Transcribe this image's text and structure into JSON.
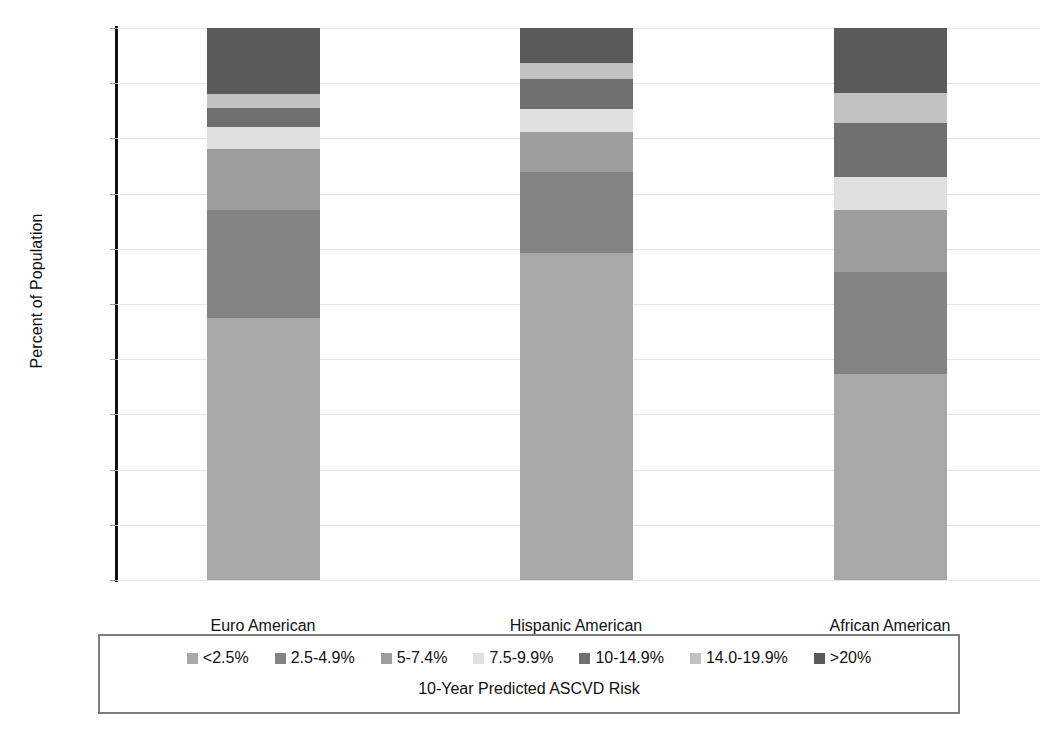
{
  "chart_data": {
    "type": "bar",
    "subtype": "stacked-percentage",
    "title": "",
    "xlabel": "10-Year Predicted ASCVD Risk",
    "ylabel": "Percent of Population",
    "categories": [
      "Euro American",
      "Hispanic American",
      "African American"
    ],
    "ylim": [
      0,
      100
    ],
    "yticks": [
      0,
      10,
      20,
      30,
      40,
      50,
      60,
      70,
      80,
      90,
      100
    ],
    "ytick_labels": [
      "0",
      "10",
      "20",
      "30",
      "40",
      "50",
      "60",
      "70",
      "80",
      "90",
      "100"
    ],
    "grid": true,
    "legend_position": "bottom",
    "series": [
      {
        "name": "<2.5%",
        "color": "#a8a8a8",
        "values": [
          47.5,
          59.2,
          37.3
        ]
      },
      {
        "name": "2.5-4.9%",
        "color": "#838383",
        "values": [
          19.6,
          14.7,
          18.5
        ]
      },
      {
        "name": "5-7.4%",
        "color": "#9d9d9d",
        "values": [
          10.9,
          7.2,
          11.2
        ]
      },
      {
        "name": "7.5-9.9%",
        "color": "#e0e0e0",
        "values": [
          4.0,
          4.3,
          6.0
        ]
      },
      {
        "name": "10-14.9%",
        "color": "#6f6f6f",
        "values": [
          3.6,
          5.4,
          9.8
        ]
      },
      {
        "name": "14.0-19.9%",
        "color": "#c2c2c2",
        "values": [
          2.4,
          2.9,
          5.4
        ]
      },
      {
        "name": ">20%",
        "color": "#5a5a5a",
        "values": [
          12.0,
          6.3,
          11.8
        ]
      }
    ]
  },
  "axis": {
    "y_title": "Percent of Population"
  },
  "legend": {
    "caption": "10-Year Predicted ASCVD Risk"
  }
}
